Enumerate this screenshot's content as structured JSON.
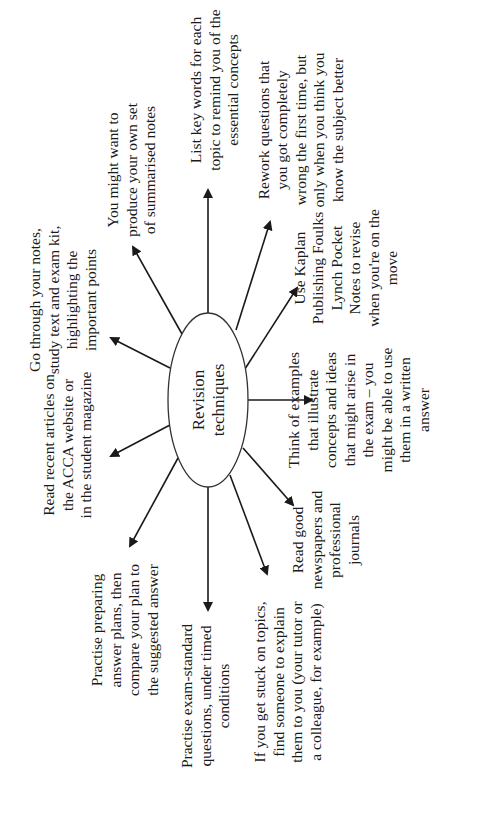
{
  "diagram": {
    "orientation": "rotated-90-ccw",
    "center": {
      "lines": [
        "Revision",
        "techniques"
      ],
      "cx": 208,
      "cy": 400,
      "rx": 40,
      "ry": 87
    },
    "nodes": [
      {
        "id": "summarised-notes",
        "lines": [
          "You might want to",
          "produce your own set",
          "of summarised notes"
        ],
        "anchor_x": 131,
        "anchor_y": 170,
        "arrow": {
          "x1": 182,
          "y1": 334,
          "x2": 133,
          "y2": 247
        }
      },
      {
        "id": "key-words",
        "lines": [
          "List key words for each",
          "topic to remind you of the",
          "essential concepts"
        ],
        "anchor_x": 214,
        "anchor_y": 90,
        "arrow": {
          "x1": 208,
          "y1": 313,
          "x2": 208,
          "y2": 190
        }
      },
      {
        "id": "rework-questions",
        "lines": [
          "Rework questions that",
          "you got completely",
          "wrong the first time, but",
          "only when you think you",
          "know the subject better"
        ],
        "anchor_x": 300,
        "anchor_y": 130,
        "arrow": {
          "x1": 236,
          "y1": 330,
          "x2": 270,
          "y2": 222
        }
      },
      {
        "id": "pocket-notes",
        "lines": [
          "Use Kaplan",
          "Publishing Foulks",
          "Lynch Pocket",
          "Notes to revise",
          "when you're on the",
          "move"
        ],
        "anchor_x": 345,
        "anchor_y": 268,
        "arrow": {
          "x1": 243,
          "y1": 372,
          "x2": 297,
          "y2": 288
        }
      },
      {
        "id": "think-examples",
        "lines": [
          "Think of examples",
          "that illustrate",
          "concepts and ideas",
          "that might arise in",
          "the exam – you",
          "might be able to use",
          "them in a written",
          "answer"
        ],
        "anchor_x": 358,
        "anchor_y": 410,
        "arrow": {
          "x1": 248,
          "y1": 400,
          "x2": 312,
          "y2": 400
        }
      },
      {
        "id": "newspapers",
        "lines": [
          "Read good",
          "newspapers and",
          "professional",
          "journals"
        ],
        "anchor_x": 325,
        "anchor_y": 540,
        "arrow": {
          "x1": 243,
          "y1": 448,
          "x2": 293,
          "y2": 505
        }
      },
      {
        "id": "explain-topics",
        "lines": [
          "If you get stuck on topics,",
          "find someone to explain",
          "them to you (your tutor or",
          "a colleague, for example)"
        ],
        "anchor_x": 287,
        "anchor_y": 682,
        "arrow": {
          "x1": 230,
          "y1": 475,
          "x2": 267,
          "y2": 574
        }
      },
      {
        "id": "exam-standard",
        "lines": [
          "Practise exam-standard",
          "questions, under timed",
          "conditions"
        ],
        "anchor_x": 205,
        "anchor_y": 696,
        "arrow": {
          "x1": 208,
          "y1": 487,
          "x2": 208,
          "y2": 610
        }
      },
      {
        "id": "answer-plans",
        "lines": [
          "Practise preparing",
          "answer plans, then",
          "compare your plan to",
          "the suggested answer"
        ],
        "anchor_x": 124,
        "anchor_y": 630,
        "arrow": {
          "x1": 178,
          "y1": 458,
          "x2": 130,
          "y2": 546
        }
      },
      {
        "id": "acca-articles",
        "lines": [
          "Read recent articles on",
          "the ACCA website or",
          "in the student magazine"
        ],
        "anchor_x": 67,
        "anchor_y": 445,
        "arrow": {
          "x1": 170,
          "y1": 425,
          "x2": 111,
          "y2": 456
        }
      },
      {
        "id": "highlight-notes",
        "lines": [
          "Go through your notes,",
          "study text and exam kit,",
          "highlighting the",
          "important points"
        ],
        "anchor_x": 62,
        "anchor_y": 300,
        "arrow": {
          "x1": 170,
          "y1": 368,
          "x2": 111,
          "y2": 338
        }
      }
    ]
  }
}
